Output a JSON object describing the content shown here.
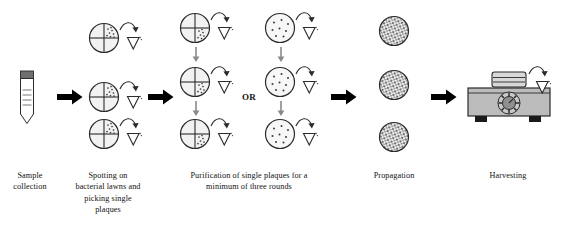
{
  "figure": {
    "background_color": "#ffffff",
    "ink_color": "#1a1a1a",
    "plate_fill": "#f2f2f2",
    "plate_stroke": "#2b2b2b",
    "dot_color": "#3a3a3a",
    "arrow_color": "#000000",
    "machine_body_color": "#b9b9b9",
    "machine_top_color": "#d0d0d0",
    "tube_cap_color": "#6e6e6e",
    "thin_arrow_color": "#8a8a8a"
  },
  "or_label": "OR",
  "captions": [
    {
      "name": "sample-collection",
      "lines": [
        "Sample",
        "collection"
      ]
    },
    {
      "name": "spotting",
      "lines": [
        "Spotting on",
        "bacterial lawns and",
        "picking single",
        "plaques"
      ]
    },
    {
      "name": "purification",
      "lines": [
        "Purification of single plaques for a",
        "minimum of three rounds"
      ]
    },
    {
      "name": "propagation",
      "lines": [
        "Propagation"
      ]
    },
    {
      "name": "harvesting",
      "lines": [
        "Harvesting"
      ]
    }
  ],
  "stages": [
    {
      "id": "stage-1",
      "label": "Sample collection",
      "icon": "sample-tube",
      "rows": 1,
      "description": "Conical sample tube with dark cap and graduation marks"
    },
    {
      "id": "stage-2",
      "label": "Spotting on bacterial lawns and picking single plaques",
      "icon": "quadrant-plate",
      "rows": 3,
      "plaque_quadrant": "upper-right",
      "has_pipette_tip": true,
      "description": "Quadrant-streaked plates with plaques in one quadrant, pick with tip"
    },
    {
      "id": "stage-3",
      "label": "Purification of single plaques for a minimum of three rounds",
      "icon": "quadrant-plate",
      "rows": 3,
      "plaque_quadrant": "lower-right",
      "has_pipette_tip": true,
      "has_vertical_arrows": true,
      "description": "Repeated purification rounds on quadrant plates"
    },
    {
      "id": "stage-3-alt",
      "label": "Purification alternative: spread plates",
      "icon": "dotted-plate",
      "rows": 3,
      "has_pipette_tip": true,
      "has_vertical_arrows": true,
      "description": "Alternative route using full spread plates with discrete plaques"
    },
    {
      "id": "stage-4",
      "label": "Propagation",
      "icon": "confluent-plate",
      "rows": 3,
      "description": "Plates with confluent lysis / dense plaque coverage"
    },
    {
      "id": "stage-5",
      "label": "Harvesting",
      "icon": "magnetic-stirrer",
      "rows": 1,
      "has_pipette_tip": true,
      "description": "Vessel on a magnetic stirrer / shaker unit with control dial"
    }
  ],
  "flow_arrows": [
    {
      "name": "arrow-1",
      "from": "stage-1",
      "to": "stage-2"
    },
    {
      "name": "arrow-2",
      "from": "stage-2",
      "to": "stage-3"
    },
    {
      "name": "arrow-3",
      "from": "stage-3-alt",
      "to": "stage-4"
    },
    {
      "name": "arrow-4",
      "from": "stage-4",
      "to": "stage-5"
    }
  ]
}
